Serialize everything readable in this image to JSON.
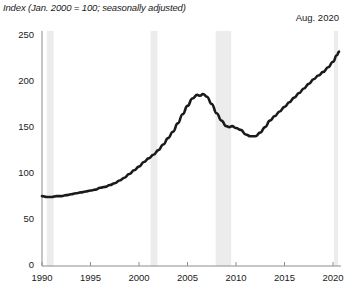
{
  "header": {
    "axis_note": "Index (Jan. 2000 = 100; seasonally adjusted)",
    "latest_label": "Aug. 2020"
  },
  "chart_data": {
    "type": "line",
    "title": "Index (Jan. 2000 = 100; seasonally adjusted)",
    "annotation": "Aug. 2020",
    "xlabel": "",
    "ylabel": "Index (Jan. 2000 = 100; seasonally adjusted)",
    "xlim": [
      1990,
      2020.7
    ],
    "ylim": [
      0,
      250
    ],
    "grid": false,
    "legend": null,
    "line_color": "#1a1a1a",
    "shade_color": "#ececec",
    "axis_color": "#8c8c8c",
    "xticks": [
      1990,
      1995,
      2000,
      2005,
      2010,
      2015,
      2020
    ],
    "xtick_labels": [
      "1990",
      "1995",
      "2000",
      "2005",
      "2010",
      "2015",
      "2020"
    ],
    "yticks": [
      0,
      50,
      100,
      150,
      200,
      250
    ],
    "ytick_labels": [
      "0",
      "50",
      "100",
      "150",
      "200",
      "250"
    ],
    "recession_bands": [
      {
        "start": 1990.5,
        "end": 1991.2
      },
      {
        "start": 2001.2,
        "end": 2001.9
      },
      {
        "start": 2007.9,
        "end": 2009.5
      },
      {
        "start": 2020.1,
        "end": 2020.4
      }
    ],
    "series": [
      {
        "name": "Home price index",
        "x": [
          1990.0,
          1990.5,
          1991.0,
          1991.5,
          1992.0,
          1992.5,
          1993.0,
          1993.5,
          1994.0,
          1994.5,
          1995.0,
          1995.5,
          1996.0,
          1996.5,
          1997.0,
          1997.5,
          1998.0,
          1998.5,
          1999.0,
          1999.5,
          2000.0,
          2000.5,
          2001.0,
          2001.5,
          2002.0,
          2002.5,
          2003.0,
          2003.5,
          2004.0,
          2004.5,
          2005.0,
          2005.5,
          2006.0,
          2006.3,
          2006.6,
          2007.0,
          2007.5,
          2008.0,
          2008.5,
          2009.0,
          2009.3,
          2009.6,
          2010.0,
          2010.5,
          2011.0,
          2011.5,
          2012.0,
          2012.5,
          2013.0,
          2013.5,
          2014.0,
          2014.5,
          2015.0,
          2015.5,
          2016.0,
          2016.5,
          2017.0,
          2017.5,
          2018.0,
          2018.5,
          2019.0,
          2019.5,
          2020.0,
          2020.4,
          2020.62
        ],
        "y": [
          76,
          75,
          75,
          76,
          76,
          77,
          78,
          79,
          80,
          81,
          82,
          83,
          85,
          86,
          88,
          90,
          93,
          96,
          100,
          104,
          108,
          113,
          117,
          121,
          126,
          132,
          139,
          146,
          155,
          165,
          174,
          182,
          186,
          185,
          187,
          184,
          176,
          166,
          158,
          152,
          151,
          152,
          150,
          148,
          143,
          141,
          141,
          145,
          151,
          158,
          163,
          168,
          173,
          178,
          183,
          188,
          193,
          198,
          203,
          207,
          211,
          216,
          222,
          229,
          233
        ]
      }
    ]
  }
}
